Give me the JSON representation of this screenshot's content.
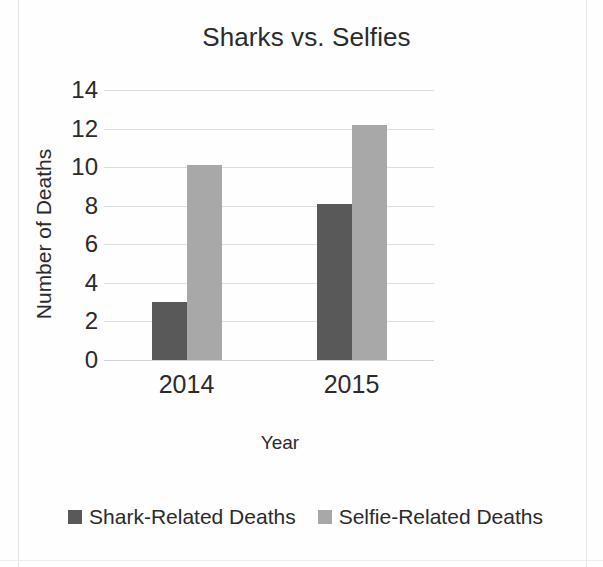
{
  "chart_data": {
    "type": "bar",
    "title": "Sharks vs. Selfies",
    "xlabel": "Year",
    "ylabel": "Number of Deaths",
    "categories": [
      "2014",
      "2015"
    ],
    "series": [
      {
        "name": "Shark-Related Deaths",
        "color": "#595959",
        "values": [
          3,
          8.1
        ]
      },
      {
        "name": "Selfie-Related Deaths",
        "color": "#a8a8a8",
        "values": [
          10.1,
          12.2
        ]
      }
    ],
    "ylim": [
      0,
      14
    ],
    "yticks": [
      0,
      2,
      4,
      6,
      8,
      10,
      12,
      14
    ],
    "grid": true,
    "legend_position": "bottom"
  },
  "legend": {
    "items": [
      {
        "label": "Shark-Related Deaths"
      },
      {
        "label": "Selfie-Related Deaths"
      }
    ]
  }
}
